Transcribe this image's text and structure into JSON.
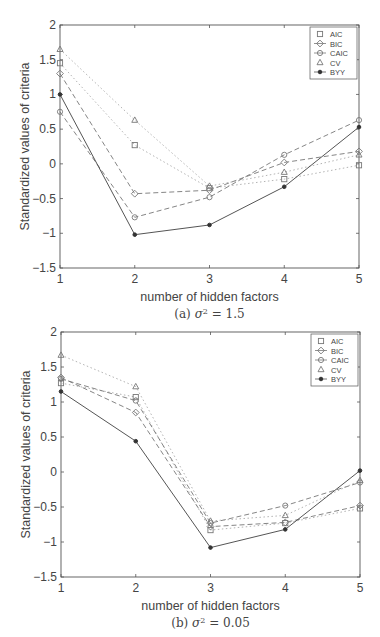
{
  "chart_data": [
    {
      "type": "line",
      "title": "",
      "caption": "(a) σ² = 1.5",
      "xlabel": "number of hidden factors",
      "ylabel": "Standardized values of criteria",
      "x": [
        1,
        2,
        3,
        4,
        5
      ],
      "xticks": [
        "1",
        "2",
        "3",
        "4",
        "5"
      ],
      "yticks": [
        "2",
        "1.5",
        "1",
        "0.5",
        "0",
        "-0.5",
        "-1",
        "-1.5"
      ],
      "xlim": [
        1,
        5
      ],
      "ylim": [
        -1.5,
        2
      ],
      "grid": false,
      "legend_position": "upper right",
      "series": [
        {
          "name": "AIC",
          "marker": "square",
          "linestyle": "dotted",
          "values": [
            1.45,
            0.27,
            -0.35,
            -0.22,
            -0.02
          ]
        },
        {
          "name": "BIC",
          "marker": "diamond",
          "linestyle": "dashed",
          "values": [
            1.3,
            -0.43,
            -0.38,
            0.02,
            0.18
          ]
        },
        {
          "name": "CAIC",
          "marker": "circle",
          "linestyle": "dashed",
          "values": [
            0.75,
            -0.77,
            -0.48,
            0.13,
            0.63
          ]
        },
        {
          "name": "CV",
          "marker": "triangle",
          "linestyle": "dotted",
          "values": [
            1.65,
            0.63,
            -0.32,
            -0.12,
            0.13
          ]
        },
        {
          "name": "BYY",
          "marker": "star",
          "linestyle": "solid",
          "values": [
            1.0,
            -1.02,
            -0.88,
            -0.33,
            0.53
          ]
        }
      ]
    },
    {
      "type": "line",
      "title": "",
      "caption": "(b) σ² = 0.05",
      "xlabel": "number of hidden factors",
      "ylabel": "Standardized values of criteria",
      "x": [
        1,
        2,
        3,
        4,
        5
      ],
      "xticks": [
        "1",
        "2",
        "3",
        "4",
        "5"
      ],
      "yticks": [
        "2",
        "1.5",
        "1",
        "0.5",
        "0",
        "-0.5",
        "-1",
        "-1.5"
      ],
      "xlim": [
        1,
        5
      ],
      "ylim": [
        -1.5,
        2
      ],
      "grid": false,
      "legend_position": "upper right",
      "series": [
        {
          "name": "AIC",
          "marker": "square",
          "linestyle": "dotted",
          "values": [
            1.27,
            1.07,
            -0.83,
            -0.73,
            -0.52
          ]
        },
        {
          "name": "BIC",
          "marker": "diamond",
          "linestyle": "dashed",
          "values": [
            1.35,
            0.85,
            -0.78,
            -0.72,
            -0.48
          ]
        },
        {
          "name": "CAIC",
          "marker": "circle",
          "linestyle": "dashed",
          "values": [
            1.33,
            1.02,
            -0.73,
            -0.48,
            -0.15
          ]
        },
        {
          "name": "CV",
          "marker": "triangle",
          "linestyle": "dotted",
          "values": [
            1.67,
            1.22,
            -0.7,
            -0.62,
            -0.12
          ]
        },
        {
          "name": "BYY",
          "marker": "star",
          "linestyle": "solid",
          "values": [
            1.15,
            0.44,
            -1.08,
            -0.82,
            0.02
          ]
        }
      ]
    }
  ],
  "captions": {
    "a_prefix": "(a) ",
    "a_sigma": "σ",
    "a_exp": "2",
    "a_value": " = 1.5",
    "b_prefix": "(b) ",
    "b_sigma": "σ",
    "b_exp": "2",
    "b_value": " = 0.05"
  },
  "colors": {
    "axis": "#555555",
    "line": "#666666",
    "dotted": "#aaaaaa",
    "text": "#444444"
  }
}
